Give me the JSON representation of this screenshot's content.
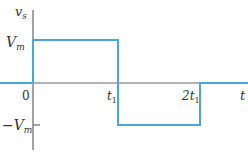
{
  "diagram": {
    "type": "square-wave-voltage-plot",
    "y_axis_label": "v",
    "y_axis_label_sub": "s",
    "x_axis_label": "t",
    "labels": {
      "vm_pos": "V",
      "vm_pos_sub": "m",
      "vm_neg": "−V",
      "vm_neg_sub": "m",
      "origin": "0",
      "t1": "t",
      "t1_sub": "1",
      "t2_prefix": "2t",
      "t2_sub": "1"
    },
    "colors": {
      "axis": "#666666",
      "waveform": "#4aa8d8",
      "text": "#333333"
    },
    "waveform_segments": [
      {
        "from": "t<0",
        "value": "0"
      },
      {
        "from": "0",
        "to": "t1",
        "value": "Vm"
      },
      {
        "from": "t1",
        "to": "2t1",
        "value": "-Vm"
      },
      {
        "from": "2t1",
        "value": "0"
      }
    ]
  }
}
